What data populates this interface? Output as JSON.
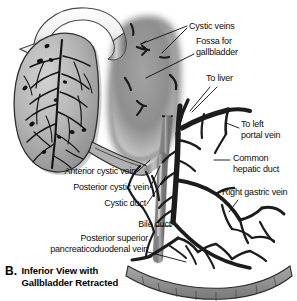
{
  "figure": {
    "id": "B",
    "caption_line1": "Inferior View with",
    "caption_line2": "Gallbladder Retracted",
    "view_description": "Inferior View with Gallbladder Retracted",
    "style": "grayscale medical anatomical illustration"
  },
  "palette": {
    "background": "#ffffff",
    "ink": "#0d0d0d",
    "organ_light": "#c9c9c9",
    "organ_mid": "#9a9a9a",
    "organ_dark": "#6d6d6d",
    "fossa_gray": "#8e8e8e",
    "vessel_dark": "#2a2a2a",
    "duct_fill": "#b8b8b8",
    "arrow_fill": "#f2f2f2",
    "arrow_shade": "#8a8a8a"
  },
  "labels": [
    {
      "key": "cystic_veins",
      "text": "Cystic veins",
      "x": 189,
      "y": 21,
      "align": "left",
      "leaders": 2
    },
    {
      "key": "fossa_for_gallbladder",
      "text_line1": "Fossa for",
      "text_line2": "gallbladder",
      "x": 196,
      "y": 44,
      "align": "left",
      "leaders": 1
    },
    {
      "key": "to_liver",
      "text": "To liver",
      "x": 206,
      "y": 77,
      "align": "left",
      "leaders": 2
    },
    {
      "key": "to_left_portal_vein",
      "text_line1": "To left",
      "text_line2": "portal vein",
      "x": 241,
      "y": 124,
      "align": "left",
      "leaders": 1
    },
    {
      "key": "common_hepatic_duct",
      "text_line1": "Common",
      "text_line2": "hepatic duct",
      "x": 232,
      "y": 156,
      "align": "left",
      "leaders": 1
    },
    {
      "key": "right_gastric_vein",
      "text": "Right gastric vein",
      "x": 223,
      "y": 191,
      "align": "left",
      "leaders": 1
    },
    {
      "key": "anterior_cystic_vein",
      "text": "Anterior cystic vein",
      "x": 58,
      "y": 170,
      "align": "left",
      "leaders": 1
    },
    {
      "key": "posterior_cystic_vein",
      "text": "Posterior cystic vein",
      "x": 62,
      "y": 186,
      "align": "left",
      "leaders": 1
    },
    {
      "key": "cystic_duct",
      "text": "Cystic duct",
      "x": 99,
      "y": 202,
      "align": "left",
      "leaders": 1
    },
    {
      "key": "bile_duct",
      "text": "Bile duct",
      "x": 135,
      "y": 222,
      "align": "left",
      "leaders": 1
    },
    {
      "key": "posterior_superior_pancreaticoduodenal_vein",
      "text_line1": "Posterior superior",
      "text_line2": "pancreaticoduodenal vein",
      "x": 33,
      "y": 238,
      "align": "left",
      "leaders": 1
    }
  ],
  "structures": [
    {
      "name": "gallbladder",
      "description": "Retracted gallbladder with venous plexus on its surface"
    },
    {
      "name": "retraction-arrow",
      "description": "Curved 3D arrow indicating gallbladder retraction/rotation"
    },
    {
      "name": "fossa-for-gallbladder",
      "description": "Shaded hepatic bed where the gallbladder normally lies"
    },
    {
      "name": "cystic-veins",
      "description": "Small veins entering the liver directly from the gallbladder bed"
    },
    {
      "name": "common-hepatic-duct",
      "description": "Duct descending from liver hilum"
    },
    {
      "name": "cystic-duct",
      "description": "Duct joining gallbladder neck to common hepatic duct"
    },
    {
      "name": "bile-duct",
      "description": "Common bile duct formed by cystic and common hepatic ducts"
    },
    {
      "name": "right-gastric-vein",
      "description": "Vein running along the lesser curvature"
    },
    {
      "name": "posterior-superior-pancreaticoduodenal-vein",
      "description": "Vein behind the duodenum draining to portal vein"
    },
    {
      "name": "duodenum",
      "description": "Duodenal arc at lower right with venous arcade"
    }
  ]
}
